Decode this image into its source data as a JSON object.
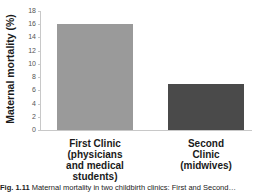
{
  "chart_data": {
    "type": "bar",
    "title": "",
    "categories": [
      "First Clinic (physicians and medical students)",
      "Second Clinic (midwives)"
    ],
    "values": [
      16,
      7
    ],
    "colors": [
      "#9a9a9a",
      "#4a4a4a"
    ],
    "xlabel": "",
    "ylabel": "Maternal mortality (%)",
    "ylim": [
      0,
      18
    ],
    "yticks": [
      0,
      2,
      4,
      6,
      8,
      10,
      12,
      14,
      16,
      18
    ],
    "grid": false,
    "legend": null
  },
  "axis": {
    "ylabel": "Maternal mortality (%)",
    "ticks": [
      "0",
      "2",
      "4",
      "6",
      "8",
      "10",
      "12",
      "14",
      "16",
      "18"
    ]
  },
  "bars": [
    {
      "label": "First Clinic\n(physicians\nand medical\nstudents)",
      "value": 16,
      "color": "#9a9a9a"
    },
    {
      "label": "Second\nClinic\n(midwives)",
      "value": 7,
      "color": "#4a4a4a"
    }
  ],
  "caption": {
    "prefix": "Fig. 1.11",
    "text": " Maternal mortality in two childbirth clinics: First and Second…"
  }
}
